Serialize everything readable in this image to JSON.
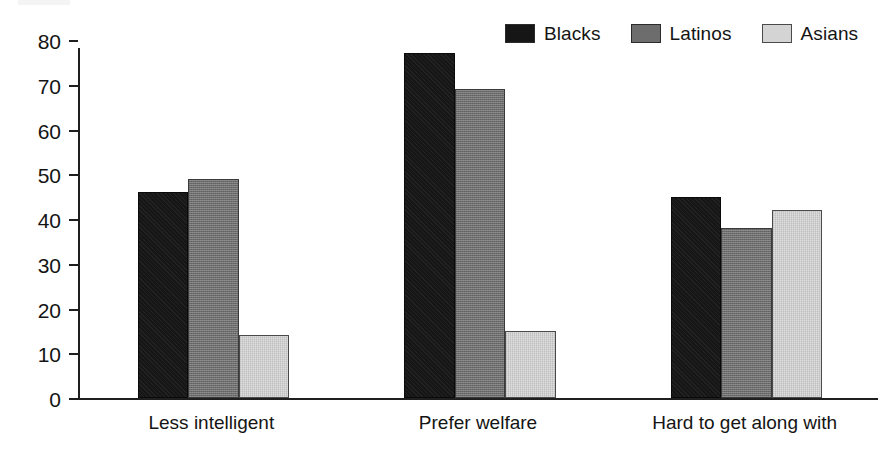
{
  "chart_data": {
    "type": "bar",
    "title": "",
    "subtitle": "",
    "xlabel": "",
    "ylabel": "",
    "categories": [
      "Less intelligent",
      "Prefer welfare",
      "Hard to get along with"
    ],
    "series": [
      {
        "name": "Blacks",
        "color": "#161616",
        "values": [
          46,
          77,
          45
        ]
      },
      {
        "name": "Latinos",
        "color": "#6d6d6d",
        "values": [
          49,
          69,
          38
        ]
      },
      {
        "name": "Asians",
        "color": "#d4d4d4",
        "values": [
          14,
          15,
          42
        ]
      }
    ],
    "ylim": [
      0,
      80
    ],
    "yticks": [
      0,
      10,
      20,
      30,
      40,
      50,
      60,
      70,
      80
    ],
    "ytick_labels": [
      "0",
      "10",
      "20",
      "30",
      "40",
      "50",
      "60",
      "70",
      "80"
    ],
    "grid": false,
    "legend_position": "top-right",
    "axis_color": "#1f1f1f",
    "background_color": "#ffffff"
  }
}
